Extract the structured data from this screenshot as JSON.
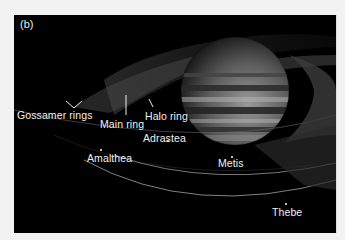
{
  "figure": {
    "panel_label": "(b)",
    "background_color": "#000000",
    "frame_color": "#f2f2f2",
    "ring_labels": {
      "gossamer": "Gossamer rings",
      "main": "Main ring",
      "halo": "Halo ring"
    },
    "moons": {
      "amalthea": "Amalthea",
      "adrastea": "Adrastea",
      "metis": "Metis",
      "thebe": "Thebe"
    }
  }
}
